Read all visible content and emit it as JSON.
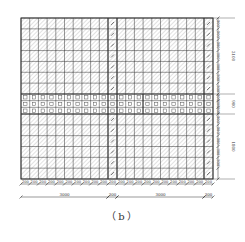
{
  "figure": {
    "caption": "（b）",
    "grid": {
      "left": 21,
      "top": 18,
      "right": 213,
      "bottom": 179,
      "columns_left": 10,
      "columns_right": 10,
      "band_top": 94,
      "band_bottom": 114,
      "center_stripe_left": 108,
      "center_stripe_right": 117,
      "right_stripe_left": 204,
      "right_stripe_right": 213,
      "band_divider_x": 143,
      "rows_top": 7,
      "rows_bottom": 6,
      "rows_band": 3
    },
    "bottom_dims": {
      "cell_labels": [
        "200",
        "200",
        "200",
        "200",
        "200",
        "200",
        "200",
        "200",
        "200",
        "200",
        "200",
        "200",
        "200",
        "200",
        "200",
        "200",
        "200",
        "200",
        "200",
        "200",
        "200",
        "200"
      ],
      "span_labels": [
        "3000",
        "300",
        "3000",
        "300"
      ]
    },
    "right_dims": {
      "cell_labels_top": [
        "300",
        "300",
        "300",
        "300",
        "300",
        "300",
        "300"
      ],
      "cell_labels_band": [
        "300",
        "300"
      ],
      "cell_labels_bottom": [
        "300",
        "300",
        "300",
        "300",
        "300",
        "300"
      ],
      "span_labels": [
        "2100",
        "900",
        "1800"
      ]
    },
    "colors": {
      "line": "#333333",
      "hatch": "#9a9a9a",
      "text": "#333333"
    }
  }
}
